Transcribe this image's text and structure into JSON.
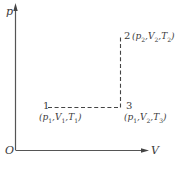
{
  "diagram": {
    "type": "p-V diagram",
    "axes": {
      "y_label": "p",
      "x_label": "V",
      "origin_label": "O"
    },
    "points": [
      {
        "id": "1",
        "label": "1",
        "state": "(p1,V1,T1)",
        "x": 48,
        "y": 107
      },
      {
        "id": "2",
        "label": "2",
        "state": "(p2,V2,T2)",
        "x": 120,
        "y": 37
      },
      {
        "id": "3",
        "label": "3",
        "state": "(p1,V2,T3)",
        "x": 120,
        "y": 107
      }
    ],
    "paths": [
      {
        "from": "1",
        "to": "3",
        "style": "dashed"
      },
      {
        "from": "3",
        "to": "2",
        "style": "dashed"
      }
    ],
    "colors": {
      "axis": "#555555",
      "dashed": "#444444",
      "text": "#3a3a3a"
    }
  }
}
